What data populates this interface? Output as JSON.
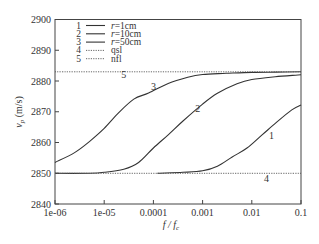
{
  "chart_data": {
    "type": "line",
    "title": "",
    "xlabel": "f / f_c",
    "ylabel": "v_p (m/s)",
    "xscale": "log",
    "xlim": [
      1e-06,
      0.1
    ],
    "ylim": [
      2840,
      2900
    ],
    "grid": false,
    "legend_position": "upper left",
    "x_ticks": [
      "1e-06",
      "1e-05",
      "0.0001",
      "0.001",
      "0.01",
      "0.1"
    ],
    "y_ticks": [
      "2840",
      "2850",
      "2860",
      "2870",
      "2880",
      "2890",
      "2900"
    ],
    "series": [
      {
        "id": "1",
        "name": "r=1cm",
        "style": "solid",
        "x": [
          0.00012,
          0.0004,
          0.001,
          0.002,
          0.004,
          0.008,
          0.016,
          0.032,
          0.065,
          0.1
        ],
        "y": [
          2850.0,
          2850.3,
          2850.8,
          2852.3,
          2855.3,
          2858.2,
          2862.4,
          2866.6,
          2870.6,
          2872.2
        ]
      },
      {
        "id": "2",
        "name": "r=10cm",
        "style": "solid",
        "x": [
          1e-06,
          5e-06,
          1e-05,
          2.5e-05,
          5e-05,
          0.0001,
          0.0002,
          0.0004,
          0.001,
          0.002,
          0.005,
          0.01,
          0.03,
          0.1
        ],
        "y": [
          2850.0,
          2850.0,
          2850.3,
          2851.3,
          2853.5,
          2858.2,
          2862.5,
          2867.0,
          2872.5,
          2876.0,
          2879.1,
          2880.5,
          2881.4,
          2882.0
        ]
      },
      {
        "id": "3",
        "name": "r=50cm",
        "style": "solid",
        "x": [
          1e-06,
          2.5e-06,
          5e-06,
          1e-05,
          2e-05,
          4e-05,
          8e-05,
          0.0002,
          0.0005,
          0.001,
          0.003,
          0.01,
          0.03,
          0.1
        ],
        "y": [
          2853.5,
          2856.7,
          2860.3,
          2864.6,
          2869.8,
          2874.1,
          2876.1,
          2879.2,
          2881.2,
          2882.1,
          2882.5,
          2882.8,
          2882.9,
          2883.0
        ]
      },
      {
        "id": "4",
        "name": "qsl",
        "style": "dotted",
        "x": [
          1e-06,
          0.1
        ],
        "y": [
          2850.0,
          2850.0
        ]
      },
      {
        "id": "5",
        "name": "nfl",
        "style": "dotted",
        "x": [
          1e-06,
          0.1
        ],
        "y": [
          2883.0,
          2883.0
        ]
      }
    ],
    "annotations": [
      {
        "text": "1",
        "x": 0.025,
        "y": 2861
      },
      {
        "text": "2",
        "x": 0.0008,
        "y": 2870
      },
      {
        "text": "3",
        "x": 0.0001,
        "y": 2877
      },
      {
        "text": "4",
        "x": 0.02,
        "y": 2847
      },
      {
        "text": "5",
        "x": 2.5e-05,
        "y": 2881
      }
    ]
  },
  "legend": {
    "items": [
      {
        "num": "1",
        "label": "r=1cm",
        "italic_prefix": "r",
        "rest": "=1cm",
        "style": "solid"
      },
      {
        "num": "2",
        "label": "r=10cm",
        "italic_prefix": "r",
        "rest": "=10cm",
        "style": "solid"
      },
      {
        "num": "3",
        "label": "r=50cm",
        "italic_prefix": "r",
        "rest": "=50cm",
        "style": "solid"
      },
      {
        "num": "4",
        "label": "qsl",
        "italic_prefix": "",
        "rest": "qsl",
        "style": "dotted"
      },
      {
        "num": "5",
        "label": "nfl",
        "italic_prefix": "",
        "rest": "nfl",
        "style": "dotted"
      }
    ]
  },
  "axes": {
    "xlabel_main": "f / f",
    "xlabel_sub": "c",
    "ylabel_main": "v",
    "ylabel_sub": "p",
    "ylabel_unit": " (m/s)"
  },
  "colors": {
    "line": "#333333",
    "axis": "#444444",
    "dotted": "#555555"
  }
}
